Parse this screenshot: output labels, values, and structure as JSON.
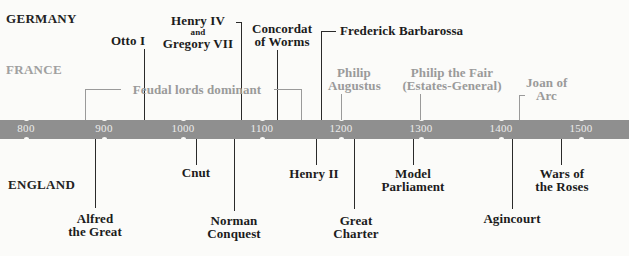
{
  "regions": {
    "germany": "GERMANY",
    "france": "FRANCE",
    "england": "ENGLAND"
  },
  "axis": {
    "ticks": [
      "800",
      "900",
      "1000",
      "1100",
      "1200",
      "1300",
      "1400",
      "1500"
    ]
  },
  "events_above": {
    "otto": "Otto I",
    "henry4_line1": "Henry IV",
    "henry4_and": "and",
    "henry4_line2": "Gregory VII",
    "concordat_line1": "Concordat",
    "concordat_line2": "of Worms",
    "frederick": "Frederick Barbarossa",
    "feudal": "Feudal lords dominant",
    "philip_aug_line1": "Philip",
    "philip_aug_line2": "Augustus",
    "philip_fair_line1": "Philip the Fair",
    "philip_fair_line2": "(Estates-General)",
    "joan_line1": "Joan of",
    "joan_line2": "Arc"
  },
  "events_below": {
    "alfred_line1": "Alfred",
    "alfred_line2": "the Great",
    "cnut": "Cnut",
    "norman_line1": "Norman",
    "norman_line2": "Conquest",
    "henry2": "Henry II",
    "charter_line1": "Great",
    "charter_line2": "Charter",
    "model_line1": "Model",
    "model_line2": "Parliament",
    "agincourt": "Agincourt",
    "wars_line1": "Wars of",
    "wars_line2": "the Roses"
  },
  "colors": {
    "band": "#8f8f8f",
    "tick_text": "#ececec",
    "dark_text": "#1c1c1c",
    "france_text": "#9a9a9a",
    "background": "#fbfbf9"
  }
}
